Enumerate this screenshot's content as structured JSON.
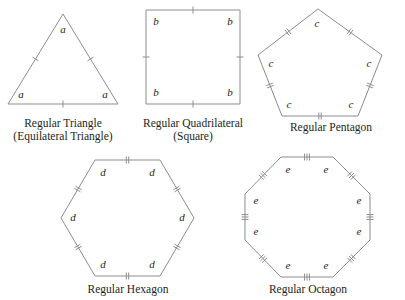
{
  "figure": {
    "background_color": "#ffffff",
    "stroke_color": "#8d8d8d",
    "text_color": "#231f20"
  },
  "shapes": [
    {
      "id": "triangle",
      "name": "Regular Triangle",
      "caption_line1": "Regular Triangle",
      "caption_line2": "(Equilateral Triangle)",
      "side_label": "a",
      "sides": 3,
      "tick_count": 1,
      "vertex_labels": [
        "a",
        "a",
        "a"
      ]
    },
    {
      "id": "square",
      "name": "Regular Quadrilateral",
      "caption_line1": "Regular Quadrilateral",
      "caption_line2": "(Square)",
      "side_label": "b",
      "sides": 4,
      "tick_count": 1,
      "vertex_labels": [
        "b",
        "b",
        "b",
        "b"
      ]
    },
    {
      "id": "pentagon",
      "name": "Regular Pentagon",
      "caption_line1": "Regular Pentagon",
      "caption_line2": "",
      "side_label": "c",
      "sides": 5,
      "tick_count": 2,
      "vertex_labels": [
        "c",
        "c",
        "c",
        "c",
        "c"
      ]
    },
    {
      "id": "hexagon",
      "name": "Regular Hexagon",
      "caption_line1": "Regular Hexagon",
      "caption_line2": "",
      "side_label": "d",
      "sides": 6,
      "tick_count": 2,
      "vertex_labels": [
        "d",
        "d",
        "d",
        "d",
        "d",
        "d"
      ]
    },
    {
      "id": "octagon",
      "name": "Regular Octagon",
      "caption_line1": "Regular Octagon",
      "caption_line2": "",
      "side_label": "e",
      "sides": 8,
      "tick_count": 3,
      "vertex_labels": [
        "e",
        "e",
        "e",
        "e",
        "e",
        "e",
        "e",
        "e"
      ]
    }
  ],
  "geometry": {
    "triangle": {
      "points": [
        [
          63,
          14
        ],
        [
          118,
          104
        ],
        [
          8,
          104
        ]
      ],
      "label_offsets": [
        [
          0,
          16
        ],
        [
          -13,
          -9
        ],
        [
          13,
          -9
        ]
      ],
      "tick_count": 1
    },
    "square": {
      "points": [
        [
          146,
          10
        ],
        [
          240,
          10
        ],
        [
          240,
          104
        ],
        [
          146,
          104
        ]
      ],
      "label_offsets": [
        [
          10,
          12
        ],
        [
          -10,
          12
        ],
        [
          -10,
          -11
        ],
        [
          10,
          -11
        ]
      ],
      "tick_count": 1
    },
    "pentagon": {
      "points": [
        [
          318,
          9
        ],
        [
          382,
          55
        ],
        [
          358,
          116
        ],
        [
          282,
          116
        ],
        [
          258,
          55
        ]
      ],
      "label_offsets": [
        [
          -1,
          15
        ],
        [
          -13,
          9
        ],
        [
          -7,
          -11
        ],
        [
          7,
          -11
        ],
        [
          13,
          9
        ]
      ],
      "tick_count": 2
    },
    "hexagon": {
      "points": [
        [
          95,
          160
        ],
        [
          160,
          160
        ],
        [
          194,
          218
        ],
        [
          160,
          276
        ],
        [
          95,
          276
        ],
        [
          61,
          218
        ]
      ],
      "label_offsets": [
        [
          8,
          13
        ],
        [
          -8,
          13
        ],
        [
          -12,
          0
        ],
        [
          -8,
          -11
        ],
        [
          8,
          -11
        ],
        [
          12,
          0
        ]
      ],
      "tick_count": 2
    },
    "octagon": {
      "points": [
        [
          281,
          157
        ],
        [
          333,
          157
        ],
        [
          370,
          194
        ],
        [
          370,
          240
        ],
        [
          333,
          277
        ],
        [
          281,
          277
        ],
        [
          245,
          240
        ],
        [
          245,
          194
        ]
      ],
      "label_offsets": [
        [
          7,
          13
        ],
        [
          -7,
          13
        ],
        [
          -11,
          7
        ],
        [
          -11,
          -8
        ],
        [
          -7,
          -11
        ],
        [
          7,
          -11
        ],
        [
          11,
          -8
        ],
        [
          11,
          7
        ]
      ],
      "tick_count": 3
    }
  },
  "captions": [
    {
      "id": "triangle",
      "x": 63,
      "y": 127,
      "line1": "Regular Triangle",
      "line2": "(Equilateral Triangle)"
    },
    {
      "id": "square",
      "x": 193,
      "y": 127,
      "line1": "Regular Quadrilateral",
      "line2": "(Square)"
    },
    {
      "id": "pentagon",
      "x": 331,
      "y": 131,
      "line1": "Regular Pentagon",
      "line2": ""
    },
    {
      "id": "hexagon",
      "x": 128,
      "y": 293,
      "line1": "Regular Hexagon",
      "line2": ""
    },
    {
      "id": "octagon",
      "x": 308,
      "y": 293,
      "line1": "Regular Octagon",
      "line2": ""
    }
  ]
}
